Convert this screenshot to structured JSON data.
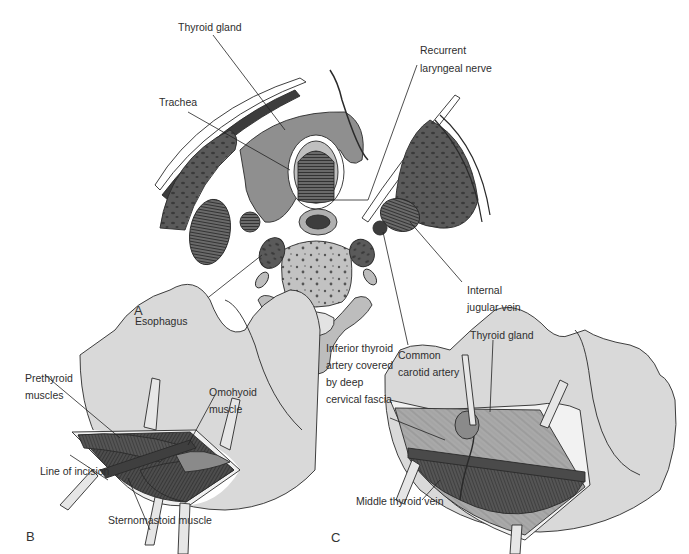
{
  "figure": {
    "panel_a": {
      "letter": "A",
      "labels": {
        "thyroid_gland": "Thyroid gland",
        "trachea": "Trachea",
        "recurrent_laryngeal_nerve_1": "Recurrent",
        "recurrent_laryngeal_nerve_2": "laryngeal nerve",
        "esophagus": "Esophagus",
        "internal_jugular_vein_1": "Internal",
        "internal_jugular_vein_2": "jugular vein",
        "common_carotid_artery_1": "Common",
        "common_carotid_artery_2": "carotid artery"
      }
    },
    "panel_b": {
      "letter": "B",
      "labels": {
        "prethyroid_muscles_1": "Prethyroid",
        "prethyroid_muscles_2": "muscles",
        "omohyoid_muscle_1": "Omohyoid",
        "omohyoid_muscle_2": "muscle",
        "line_of_incision": "Line of incision",
        "sternomastoid_muscle": "Sternomastoid muscle"
      }
    },
    "panel_c": {
      "letter": "C",
      "labels": {
        "inferior_thyroid_artery_1": "Inferior thyroid",
        "inferior_thyroid_artery_2": "artery covered",
        "inferior_thyroid_artery_3": "by deep",
        "inferior_thyroid_artery_4": "cervical fascia",
        "thyroid_gland": "Thyroid gland",
        "middle_thyroid_vein": "Middle thyroid vein"
      }
    },
    "colors": {
      "skin": "#d9d9d9",
      "muscle_dark": "#4a4a4a",
      "gland": "#8f8f8f",
      "bone": "#bdbdbd",
      "line": "#2a2a2a"
    }
  }
}
